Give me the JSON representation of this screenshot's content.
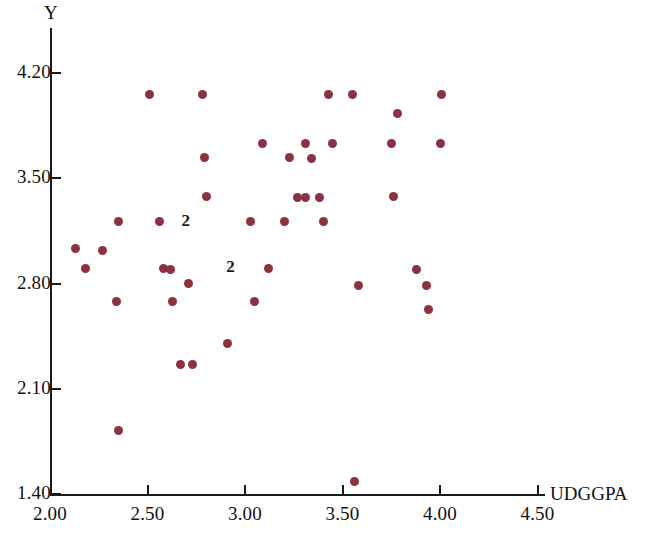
{
  "chart_data": {
    "type": "scatter",
    "title": "",
    "xlabel": "UDGGPA",
    "ylabel": "Y",
    "xlim": [
      2.0,
      4.6
    ],
    "ylim": [
      1.4,
      4.38
    ],
    "grid": false,
    "legend": null,
    "marker_color": "#8c3140",
    "axis_color": "#1a1a1a",
    "xticks": [
      "2.00",
      "2.50",
      "3.00",
      "3.50",
      "4.00",
      "4.50"
    ],
    "xtick_values": [
      2.0,
      2.5,
      3.0,
      3.5,
      4.0,
      4.5
    ],
    "yticks": [
      "4.20",
      "3.50",
      "2.80",
      "2.10",
      "1.40"
    ],
    "ytick_values": [
      4.2,
      3.5,
      2.8,
      2.1,
      1.4
    ],
    "points": [
      {
        "x": 2.13,
        "y": 3.03
      },
      {
        "x": 2.18,
        "y": 2.9
      },
      {
        "x": 2.27,
        "y": 3.02
      },
      {
        "x": 2.35,
        "y": 3.21
      },
      {
        "x": 2.34,
        "y": 2.68
      },
      {
        "x": 2.35,
        "y": 1.82
      },
      {
        "x": 2.51,
        "y": 4.06
      },
      {
        "x": 2.56,
        "y": 3.21
      },
      {
        "x": 2.58,
        "y": 2.9
      },
      {
        "x": 2.62,
        "y": 2.89
      },
      {
        "x": 2.63,
        "y": 2.68
      },
      {
        "x": 2.67,
        "y": 2.26
      },
      {
        "x": 2.71,
        "y": 2.8
      },
      {
        "x": 2.73,
        "y": 2.26
      },
      {
        "x": 2.78,
        "y": 4.06
      },
      {
        "x": 2.79,
        "y": 3.64
      },
      {
        "x": 2.8,
        "y": 3.38
      },
      {
        "x": 2.91,
        "y": 2.4
      },
      {
        "x": 3.03,
        "y": 3.21
      },
      {
        "x": 3.05,
        "y": 2.68
      },
      {
        "x": 3.09,
        "y": 3.73
      },
      {
        "x": 3.12,
        "y": 2.9
      },
      {
        "x": 3.2,
        "y": 3.21
      },
      {
        "x": 3.23,
        "y": 3.64
      },
      {
        "x": 3.27,
        "y": 3.37
      },
      {
        "x": 3.31,
        "y": 3.37
      },
      {
        "x": 3.31,
        "y": 3.73
      },
      {
        "x": 3.34,
        "y": 3.63
      },
      {
        "x": 3.38,
        "y": 3.37
      },
      {
        "x": 3.4,
        "y": 3.21
      },
      {
        "x": 3.43,
        "y": 4.06
      },
      {
        "x": 3.45,
        "y": 3.73
      },
      {
        "x": 3.55,
        "y": 4.06
      },
      {
        "x": 3.56,
        "y": 1.48
      },
      {
        "x": 3.58,
        "y": 2.79
      },
      {
        "x": 3.75,
        "y": 3.73
      },
      {
        "x": 3.76,
        "y": 3.38
      },
      {
        "x": 3.78,
        "y": 3.93
      },
      {
        "x": 3.88,
        "y": 2.89
      },
      {
        "x": 3.93,
        "y": 2.79
      },
      {
        "x": 3.94,
        "y": 2.63
      },
      {
        "x": 4.0,
        "y": 3.73
      },
      {
        "x": 4.01,
        "y": 4.06
      }
    ],
    "overlap_annotations": [
      {
        "label": "2",
        "x": 2.7,
        "y": 3.21
      },
      {
        "label": "2",
        "x": 2.93,
        "y": 2.9
      }
    ]
  }
}
